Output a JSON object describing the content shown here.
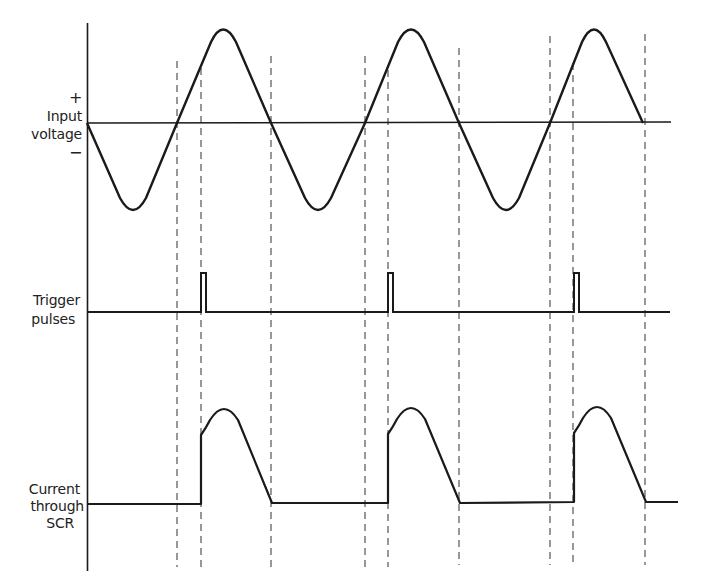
{
  "diagram": {
    "colors": {
      "line": "#1a1a1a",
      "dash": "#444444",
      "background": "#ffffff"
    },
    "labels": {
      "input_plus": "+",
      "input_line1": "Input",
      "input_line2": "voltage",
      "input_minus": "−",
      "trigger_line1": "Trigger",
      "trigger_line2": "pulses",
      "current_line1": "Current",
      "current_line2": "through",
      "current_line3": "SCR"
    },
    "traces": [
      {
        "name": "Input voltage",
        "baseline_y": 123,
        "shape": "sine",
        "zero_crossings_x": [
          87,
          177,
          271,
          365,
          459,
          550,
          643
        ]
      },
      {
        "name": "Trigger pulses",
        "baseline_y": 312,
        "pulse_top_y": 273,
        "pulses_x": [
          201,
          388,
          574
        ]
      },
      {
        "name": "Current through SCR",
        "baseline_y": 504,
        "conduction_windows": [
          [
            201,
            272
          ],
          [
            388,
            460
          ],
          [
            574,
            646
          ]
        ]
      }
    ],
    "dashed_guides_x": [
      177,
      201,
      271,
      365,
      388,
      459,
      550,
      574,
      645
    ]
  }
}
